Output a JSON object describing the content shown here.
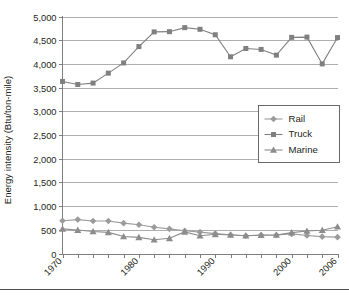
{
  "chart_data": {
    "type": "line",
    "title": "",
    "xlabel": "",
    "ylabel": "Energy intensity (Btu/ton-mile)",
    "ylim": [
      0,
      5000
    ],
    "xlim": [
      1970,
      2006
    ],
    "ytick_labels": [
      "0",
      "500",
      "1,000",
      "1,500",
      "2,000",
      "2,500",
      "3,000",
      "3,500",
      "4,000",
      "4,500",
      "5,000"
    ],
    "ytick_values": [
      0,
      500,
      1000,
      1500,
      2000,
      2500,
      3000,
      3500,
      4000,
      4500,
      5000
    ],
    "xtick_labels": [
      "1970",
      "1980",
      "1990",
      "2000",
      "2006"
    ],
    "xtick_values": [
      1970,
      1980,
      1990,
      2000,
      2006
    ],
    "grid": "horizontal",
    "legend_position": "center-right",
    "x": [
      1970,
      1972,
      1974,
      1976,
      1978,
      1980,
      1982,
      1984,
      1986,
      1988,
      1990,
      1992,
      1994,
      1996,
      1998,
      2000,
      2002,
      2004,
      2006
    ],
    "series": [
      {
        "name": "Rail",
        "marker": "diamond",
        "color": "#9b9b9b",
        "values": [
          690,
          715,
          685,
          685,
          640,
          605,
          555,
          520,
          480,
          450,
          420,
          395,
          375,
          390,
          390,
          415,
          380,
          355,
          345
        ]
      },
      {
        "name": "Truck",
        "marker": "square",
        "color": "#808080",
        "values": [
          3630,
          3565,
          3595,
          3805,
          4020,
          4365,
          4675,
          4680,
          4765,
          4730,
          4615,
          4150,
          4325,
          4305,
          4185,
          4560,
          4565,
          4000,
          4555
        ]
      },
      {
        "name": "Marine",
        "marker": "triangle",
        "color": "#8c8c8c",
        "values": [
          520,
          495,
          465,
          445,
          360,
          340,
          290,
          320,
          455,
          375,
          405,
          390,
          375,
          385,
          390,
          440,
          475,
          490,
          565
        ]
      }
    ]
  },
  "legend": {
    "items": [
      {
        "label": "Rail"
      },
      {
        "label": "Truck"
      },
      {
        "label": "Marine"
      }
    ]
  }
}
